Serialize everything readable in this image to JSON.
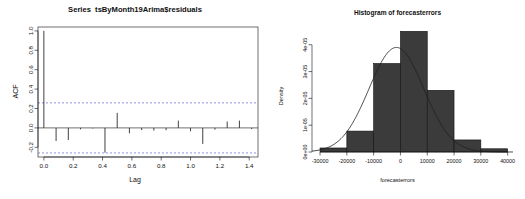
{
  "figure": {
    "background": "#ffffff",
    "ink": "#101010",
    "panels": 2
  },
  "acf_panel": {
    "title": "Series  tsByMonth19Arima$residuals",
    "xlabel": "Lag",
    "ylabel": "ACF",
    "conf_color": "#4a4acd",
    "bar_color": "#2b2b2b"
  },
  "hist_panel": {
    "title": "Histogram of forecasterrors",
    "xlabel": "forecasterrors",
    "ylabel": "Density",
    "bar_fill": "#3b3b3b",
    "bar_edge": "#101010",
    "curve_color": "#202020"
  },
  "chart_data": [
    {
      "type": "bar",
      "name": "acf-correlogram",
      "title": "Series  tsByMonth19Arima$residuals",
      "xlabel": "Lag",
      "ylabel": "ACF",
      "xlim": [
        -0.04,
        1.46
      ],
      "ylim": [
        -0.3,
        1.04
      ],
      "xticks": [
        0.0,
        0.2,
        0.4,
        0.6,
        0.8,
        1.0,
        1.2,
        1.4
      ],
      "xticklabels": [
        "0.0",
        "0.2",
        "0.4",
        "0.6",
        "0.8",
        "1.0",
        "1.2",
        "1.4"
      ],
      "yticks": [
        -0.2,
        0.0,
        0.2,
        0.4,
        0.6,
        0.8,
        1.0
      ],
      "yticklabels": [
        "-0.2",
        "0.0",
        "0.2",
        "0.4",
        "0.6",
        "0.8",
        "1.0"
      ],
      "grid": false,
      "confidence_bounds": [
        0.258,
        -0.258
      ],
      "confidence_style": "dashed",
      "zero_line": 0.0,
      "x": [
        0.0,
        0.0833,
        0.1667,
        0.25,
        0.3333,
        0.4167,
        0.5,
        0.5833,
        0.6667,
        0.75,
        0.8333,
        0.9167,
        1.0,
        1.0833,
        1.1667,
        1.25,
        1.3333,
        1.4167
      ],
      "values": [
        1.0,
        -0.135,
        -0.125,
        -0.015,
        -0.006,
        -0.255,
        0.155,
        -0.055,
        -0.022,
        -0.028,
        -0.024,
        0.075,
        -0.035,
        -0.165,
        -0.018,
        0.065,
        0.075,
        -0.012
      ]
    },
    {
      "type": "bar",
      "name": "forecast-errors-histogram",
      "title": "Histogram of forecasterrors",
      "xlabel": "forecasterrors",
      "ylabel": "Density",
      "xlim": [
        -33000,
        42000
      ],
      "ylim": [
        0,
        4.55e-05
      ],
      "xticks": [
        -30000,
        -20000,
        -10000,
        0,
        10000,
        20000,
        30000,
        40000
      ],
      "xticklabels": [
        "-30000",
        "-20000",
        "-10000",
        "0",
        "10000",
        "20000",
        "30000",
        "40000"
      ],
      "yticks": [
        0,
        1e-05,
        2e-05,
        3e-05,
        4e-05
      ],
      "yticklabels": [
        "0e+00",
        "1e-05",
        "2e-05",
        "3e-05",
        "4e-05"
      ],
      "grid": false,
      "bin_edges": [
        -30000,
        -20000,
        -10000,
        0,
        10000,
        20000,
        30000,
        40000
      ],
      "bin_width": 10000,
      "values": [
        1.5e-06,
        7.8e-06,
        3.3e-05,
        4.5e-05,
        2.3e-05,
        4.5e-06,
        1.2e-06
      ],
      "overlay": {
        "type": "line",
        "name": "normal-density-curve",
        "mean": -1500,
        "sd": 10200,
        "peak": 3.9e-05
      }
    }
  ]
}
